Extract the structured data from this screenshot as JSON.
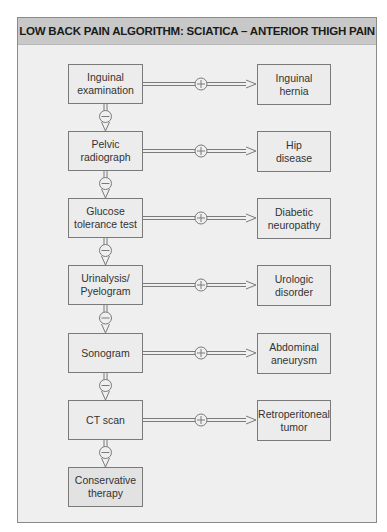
{
  "title": "LOW BACK PAIN ALGORITHM: SCIATICA – ANTERIOR THIGH PAIN",
  "positive_symbol": "+",
  "negative_symbol": "−",
  "tests": [
    {
      "label": "Inguinal\nexamination",
      "positive_result": "Inguinal\nhernia"
    },
    {
      "label": "Pelvic\nradiograph",
      "positive_result": "Hip\ndisease"
    },
    {
      "label": "Glucose\ntolerance test",
      "positive_result": "Diabetic\nneuropathy"
    },
    {
      "label": "Urinalysis/\nPyelogram",
      "positive_result": "Urologic\ndisorder"
    },
    {
      "label": "Sonogram",
      "positive_result": "Abdominal\naneurysm"
    },
    {
      "label": "CT scan",
      "positive_result": "Retroperitoneal\ntumor"
    }
  ],
  "final_step": {
    "label": "Conservative\ntherapy"
  },
  "colors": {
    "header_bg": "#c8c8c8",
    "panel_bg": "#efefef",
    "box_border": "#7a7a7a",
    "text": "#333333"
  }
}
